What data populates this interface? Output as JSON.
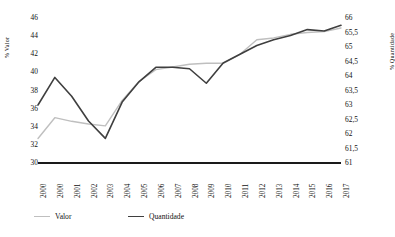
{
  "chart_data": {
    "type": "line",
    "title": "",
    "subtitle": "",
    "xlabel": "",
    "ylabel": "% Valor",
    "y2label": "% Quantidade",
    "grid": false,
    "legend_position": "bottom-left",
    "categories": [
      "2000",
      "2000",
      "2001",
      "2002",
      "2003",
      "2004",
      "2005",
      "2006",
      "2007",
      "2008",
      "2009",
      "2010",
      "2011",
      "2012",
      "2013",
      "2014",
      "2015",
      "2016",
      "2017"
    ],
    "x_tick_labels": [
      "2000",
      "2000",
      "2001",
      "2002",
      "2003",
      "2004",
      "2005",
      "2006",
      "2007",
      "2008",
      "2009",
      "2010",
      "2011",
      "2012",
      "2013",
      "2014",
      "2015",
      "2016",
      "2017"
    ],
    "ylim": [
      30,
      46
    ],
    "y_tick_labels": [
      "46",
      "44",
      "42",
      "40",
      "38",
      "36",
      "34",
      "32",
      "30"
    ],
    "y_ticks": [
      46,
      44,
      42,
      40,
      38,
      36,
      34,
      32,
      30
    ],
    "y2lim": [
      61,
      66
    ],
    "y2_tick_labels": [
      "66",
      "65,5",
      "65",
      "64,5",
      "64",
      "63,5",
      "63",
      "62,5",
      "62",
      "61,5",
      "61"
    ],
    "y2_ticks": [
      66,
      65.5,
      65,
      64.5,
      64,
      63.5,
      63,
      62.5,
      62,
      61.5,
      61
    ],
    "series": [
      {
        "name": "Valor",
        "axis": "left",
        "color": "#bfbfbf",
        "line_width": 1.4,
        "values": [
          32.7,
          35.0,
          34.6,
          34.3,
          34.1,
          36.9,
          39.0,
          40.3,
          40.6,
          40.9,
          41.0,
          41.0,
          42.0,
          43.6,
          43.8,
          44.2,
          44.4,
          44.5,
          44.9
        ]
      },
      {
        "name": "Quantidade",
        "axis": "right",
        "color": "#3f3f3f",
        "line_width": 1.6,
        "values": [
          63.0,
          63.95,
          63.3,
          62.45,
          61.85,
          63.1,
          63.8,
          64.3,
          64.3,
          64.25,
          63.75,
          64.45,
          64.75,
          65.05,
          65.25,
          65.4,
          65.6,
          65.55,
          65.75
        ]
      }
    ],
    "series_left_scale_equivalent": {
      "Quantidade_as_left_axis": [
        36.0,
        39.1,
        37.0,
        34.3,
        32.4,
        36.4,
        38.6,
        40.5,
        40.5,
        40.3,
        38.9,
        41.1,
        42.1,
        43.1,
        43.8,
        44.3,
        44.9,
        44.7,
        45.3
      ]
    }
  },
  "legend": {
    "items": [
      {
        "label": "Valor",
        "color": "#bfbfbf"
      },
      {
        "label": "Quantidade",
        "color": "#3f3f3f"
      }
    ]
  }
}
